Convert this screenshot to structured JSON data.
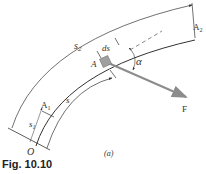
{
  "figure": {
    "caption": "Fig. 10.10",
    "subfigure_label": "(a)",
    "labels": {
      "s2": "s",
      "s2_sub": "2",
      "A2": "A",
      "A2_sub": "2",
      "ds": "ds",
      "A": "A",
      "alpha": "α",
      "F": "F",
      "A1": "A",
      "A1_sub": "1",
      "s1": "s",
      "s1_sub": "1",
      "s": "s",
      "O": "O"
    },
    "colors": {
      "line": "#333333",
      "force_arrow": "#8c8c8c",
      "block": "#a0a0a0"
    }
  }
}
